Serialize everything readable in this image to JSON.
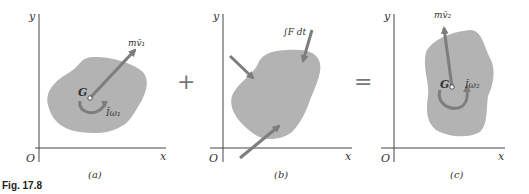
{
  "figure": {
    "caption": "Fig. 17.8",
    "colors": {
      "body_fill": "#b3b3b3",
      "arrow": "#7d7d7d",
      "axis": "#444444",
      "text": "#333333"
    },
    "operators": {
      "plus": "+",
      "equals": "="
    },
    "panels": [
      {
        "id": "a",
        "label": "(a)",
        "axis_y": "y",
        "axis_x": "x",
        "origin": "O",
        "center": "G",
        "momentum_label": "mv̄₁",
        "angular_label": "Īω₁"
      },
      {
        "id": "b",
        "label": "(b)",
        "axis_y": "y",
        "axis_x": "x",
        "origin": "O",
        "impulse_label": "∫F dt"
      },
      {
        "id": "c",
        "label": "(c)",
        "axis_y": "y",
        "axis_x": "x",
        "origin": "O",
        "center": "G",
        "momentum_label": "mv̄₂",
        "angular_label": "Īω₂"
      }
    ]
  }
}
